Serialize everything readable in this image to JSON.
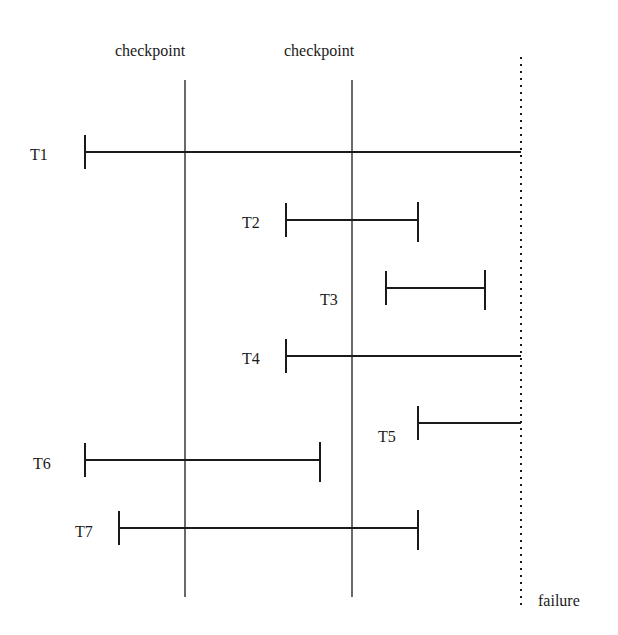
{
  "checkpoints": [
    {
      "label": "checkpoint",
      "x": 185,
      "label_x": 149
    },
    {
      "label": "checkpoint",
      "x": 352,
      "label_x": 318
    }
  ],
  "failure": {
    "label": "failure",
    "x": 521
  },
  "transactions": [
    {
      "label": "T1",
      "y": 152,
      "start": 85,
      "end": 521,
      "end_tick": false,
      "lx": 30,
      "ly": 160
    },
    {
      "label": "T2",
      "y": 220,
      "start": 286,
      "end": 418,
      "end_tick": true,
      "lx": 242,
      "ly": 228
    },
    {
      "label": "T3",
      "y": 288,
      "start": 386,
      "end": 485,
      "end_tick": true,
      "lx": 320,
      "ly": 305
    },
    {
      "label": "T4",
      "y": 356,
      "start": 286,
      "end": 521,
      "end_tick": false,
      "lx": 242,
      "ly": 364
    },
    {
      "label": "T5",
      "y": 423,
      "start": 418,
      "end": 521,
      "end_tick": false,
      "lx": 378,
      "ly": 442
    },
    {
      "label": "T6",
      "y": 460,
      "start": 85,
      "end": 320,
      "end_tick": true,
      "lx": 33,
      "ly": 469
    },
    {
      "label": "T7",
      "y": 528,
      "start": 119,
      "end": 418,
      "end_tick": true,
      "lx": 75,
      "ly": 537
    }
  ]
}
